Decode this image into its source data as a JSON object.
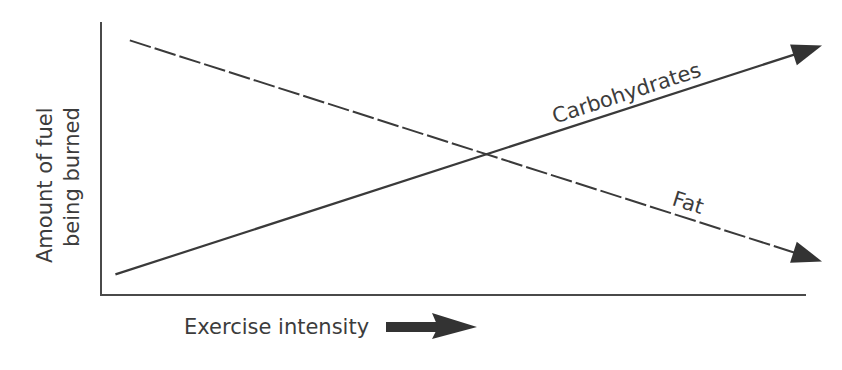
{
  "chart_data": {
    "type": "line",
    "title": "",
    "xlabel": "Exercise intensity",
    "ylabel_lines": [
      "Amount of fuel",
      "being burned"
    ],
    "ylabel": "Amount of fuel being burned",
    "xlim": [
      0,
      100
    ],
    "ylim": [
      0,
      100
    ],
    "units": "relative (no tick marks shown)",
    "grid": false,
    "legend": "none (inline labels on lines)",
    "x_ticks": [],
    "y_ticks": [],
    "series": [
      {
        "name": "Carbohydrates",
        "label": "Carbohydrates",
        "style": "solid",
        "arrow_end": true,
        "x": [
          2,
          100
        ],
        "y": [
          6,
          94
        ]
      },
      {
        "name": "Fat",
        "label": "Fat",
        "style": "dashed",
        "arrow_end": true,
        "x": [
          4,
          100
        ],
        "y": [
          96,
          11
        ]
      }
    ],
    "annotations": [
      {
        "text": "Exercise intensity",
        "type": "axis-label-with-arrow",
        "arrow_direction": "right"
      }
    ],
    "colors": {
      "axis": "#4a4a4a",
      "line": "#3a3a3a",
      "text": "#3c3c3c",
      "background": "#ffffff"
    }
  }
}
